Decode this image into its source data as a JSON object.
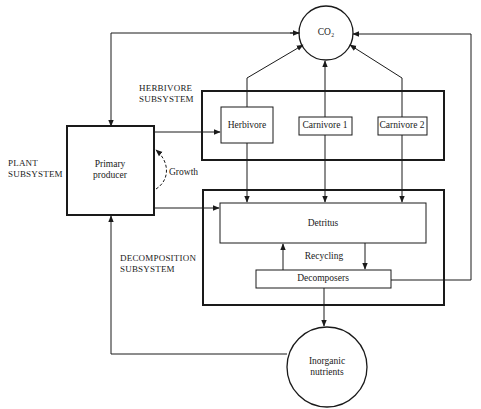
{
  "diagram": {
    "colors": {
      "line": "#1a1a1a",
      "background": "#ffffff"
    },
    "subsystems": {
      "plant": [
        "PLANT",
        "SUBSYSTEM"
      ],
      "herbivore": [
        "HERBIVORE",
        "SUBSYSTEM"
      ],
      "decomposition": [
        "DECOMPOSITION",
        "SUBSYSTEM"
      ]
    },
    "nodes": {
      "co2": "CO₂",
      "primary_producer": [
        "Primary",
        "producer"
      ],
      "herbivore": "Herbivore",
      "carnivore1": "Carnivore 1",
      "carnivore2": "Carnivore 2",
      "detritus": "Detritus",
      "decomposers": "Decomposers",
      "inorganic_nutrients": [
        "Inorganic",
        "nutrients"
      ]
    },
    "flow_labels": {
      "growth": "Growth",
      "recycling": "Recycling"
    }
  }
}
